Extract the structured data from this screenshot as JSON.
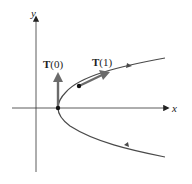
{
  "diagram": {
    "axes": {
      "x_label": "x",
      "y_label": "y"
    },
    "curve": {
      "description": "parabola opening right, vertex on x-axis",
      "color": "#4a4a4a"
    },
    "vectors": [
      {
        "label_bold": "T",
        "label_arg": "(0)",
        "color": "#6b6b6b"
      },
      {
        "label_bold": "T",
        "label_arg": "(1)",
        "color": "#6b6b6b"
      }
    ],
    "points": [
      {
        "name": "vertex"
      },
      {
        "name": "t=1 point"
      }
    ]
  }
}
